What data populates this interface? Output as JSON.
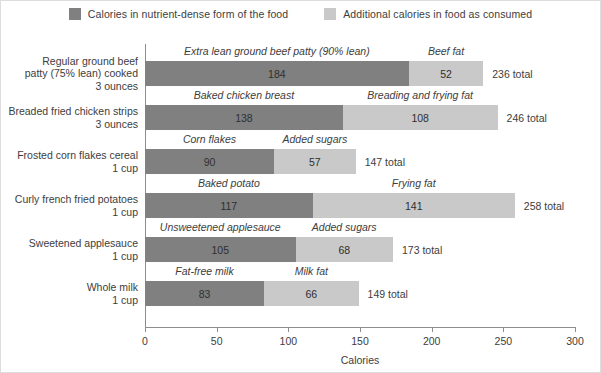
{
  "legend": {
    "items": [
      {
        "label": "Calories in nutrient-dense form of the food",
        "color": "#808080",
        "swatch": "dark-gray-swatch"
      },
      {
        "label": "Additional calories in food as consumed",
        "color": "#c9c9c9",
        "swatch": "light-gray-swatch"
      }
    ]
  },
  "axis": {
    "xlabel": "Calories",
    "ticks": [
      "0",
      "50",
      "100",
      "150",
      "200",
      "250",
      "300"
    ]
  },
  "chart_data": {
    "type": "bar",
    "orientation": "horizontal",
    "stacked": true,
    "title": "",
    "xlabel": "Calories",
    "ylabel": "",
    "xlim": [
      0,
      300
    ],
    "xticks": [
      0,
      50,
      100,
      150,
      200,
      250,
      300
    ],
    "grid": false,
    "legend": [
      "Calories in nutrient-dense form of the food",
      "Additional calories in food as consumed"
    ],
    "legend_position": "top-center",
    "colors": {
      "nutrient_dense": "#808080",
      "additional": "#c9c9c9"
    },
    "categories": [
      "Regular ground beef patty (75% lean) cooked 3 ounces",
      "Breaded fried chicken strips 3 ounces",
      "Frosted corn flakes cereal 1 cup",
      "Curly french fried potatoes 1 cup",
      "Sweetened applesauce 1 cup",
      "Whole milk 1 cup"
    ],
    "series": [
      {
        "name": "Calories in nutrient-dense form of the food",
        "values": [
          184,
          138,
          90,
          117,
          105,
          83
        ]
      },
      {
        "name": "Additional calories in food as consumed",
        "values": [
          52,
          108,
          57,
          141,
          68,
          66
        ]
      }
    ],
    "totals": [
      236,
      246,
      147,
      258,
      173,
      149
    ]
  },
  "rows": [
    {
      "label_lines": [
        "Regular ground beef",
        "patty (75% lean) cooked",
        "3 ounces"
      ],
      "base": {
        "caption": "Extra lean ground beef patty (90% lean)",
        "value": 184,
        "value_label": "184"
      },
      "extra": {
        "caption": "Beef fat",
        "value": 52,
        "value_label": "52"
      },
      "total_label": "236 total"
    },
    {
      "label_lines": [
        "Breaded fried chicken strips",
        "3 ounces"
      ],
      "base": {
        "caption": "Baked chicken breast",
        "value": 138,
        "value_label": "138"
      },
      "extra": {
        "caption": "Breading and frying fat",
        "value": 108,
        "value_label": "108"
      },
      "total_label": "246 total"
    },
    {
      "label_lines": [
        "Frosted corn flakes cereal",
        "1 cup"
      ],
      "base": {
        "caption": "Corn flakes",
        "value": 90,
        "value_label": "90"
      },
      "extra": {
        "caption": "Added sugars",
        "value": 57,
        "value_label": "57"
      },
      "total_label": "147 total"
    },
    {
      "label_lines": [
        "Curly french fried potatoes",
        "1 cup"
      ],
      "base": {
        "caption": "Baked potato",
        "value": 117,
        "value_label": "117"
      },
      "extra": {
        "caption": "Frying fat",
        "value": 141,
        "value_label": "141"
      },
      "total_label": "258 total"
    },
    {
      "label_lines": [
        "Sweetened applesauce",
        "1 cup"
      ],
      "base": {
        "caption": "Unsweetened applesauce",
        "value": 105,
        "value_label": "105"
      },
      "extra": {
        "caption": "Added sugars",
        "value": 68,
        "value_label": "68"
      },
      "total_label": "173 total"
    },
    {
      "label_lines": [
        "Whole milk",
        "1 cup"
      ],
      "base": {
        "caption": "Fat-free milk",
        "value": 83,
        "value_label": "83"
      },
      "extra": {
        "caption": "Milk fat",
        "value": 66,
        "value_label": "66"
      },
      "total_label": "149 total"
    }
  ]
}
